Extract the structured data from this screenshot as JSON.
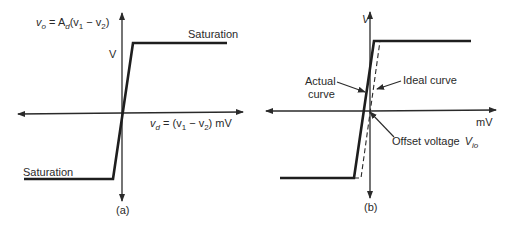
{
  "panels": [
    {
      "id": "a",
      "caption": "(a)",
      "y_axis_unit": "V",
      "x_axis_label": "v_d = (v_1 − v_2) mV",
      "output_equation": "v_o = A_d(v_1 − v_2)",
      "upper_label": "Saturation",
      "lower_label": "Saturation"
    },
    {
      "id": "b",
      "caption": "(b)",
      "y_axis_unit": "V",
      "x_axis_unit": "mV",
      "annotations": {
        "actual_line1": "Actual",
        "actual_line2": "curve",
        "ideal": "Ideal curve",
        "offset": "Offset voltage",
        "offset_symbol": "V",
        "offset_sub": "io"
      }
    }
  ],
  "text": {
    "a_eq_v": "v",
    "a_eq_o": "o",
    "a_eq_rest": " = A",
    "a_eq_d": "d",
    "a_eq_paren": "(v",
    "a_eq_1": "1",
    "a_eq_minus": " − v",
    "a_eq_2": "2",
    "a_eq_close": ")",
    "a_x_v": "v",
    "a_x_d": "d",
    "a_x_eq": " = (v",
    "a_x_1": "1",
    "a_x_minus": " − v",
    "a_x_2": "2",
    "a_x_close": ") mV"
  },
  "colors": {
    "ink": "#2a2a2a",
    "background": "#ffffff"
  }
}
